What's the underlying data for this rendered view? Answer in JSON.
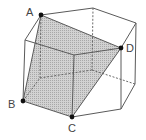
{
  "diagram": {
    "points": {
      "A": {
        "label": "A",
        "x": 41,
        "y": 15
      },
      "B": {
        "label": "B",
        "x": 23,
        "y": 101
      },
      "C": {
        "label": "C",
        "x": 72,
        "y": 117
      },
      "D": {
        "label": "D",
        "x": 121,
        "y": 48
      }
    },
    "colors": {
      "edge": "#5a5a5a",
      "shade": "#c4c4c4",
      "point": "#111111",
      "label": "#444444"
    }
  }
}
